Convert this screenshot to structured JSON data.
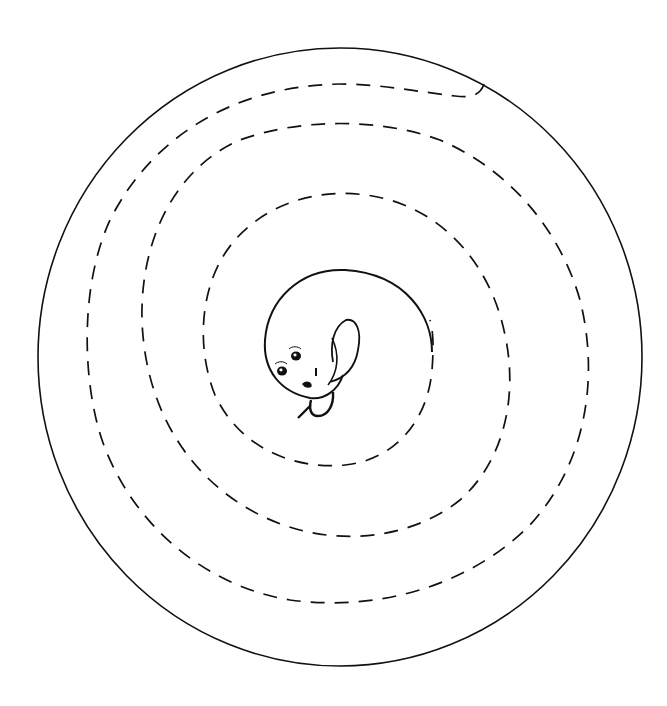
{
  "illustration": {
    "subject": "spiral maze with curled creature at center",
    "background_color": "#ffffff",
    "stroke_color": "#111111",
    "outer_circle": {
      "cx": 340,
      "cy": 357,
      "r": 301
    },
    "spiral_path": {
      "style": "dashed",
      "start": "outer circle at top-right",
      "end": "creature at center",
      "turns": 3
    },
    "creature": {
      "description": "round curled creature with two eyes, small mouth and tail",
      "head_center": [
        305,
        345
      ],
      "eyes": 2
    }
  }
}
